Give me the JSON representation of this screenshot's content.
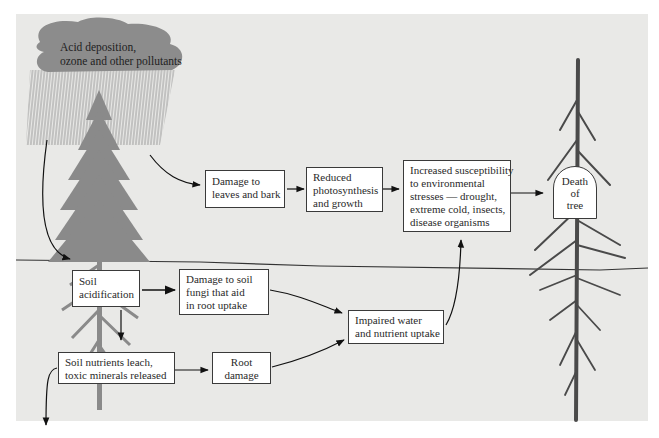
{
  "source": {
    "label_lines": [
      "Acid deposition,",
      "ozone and other pollutants"
    ]
  },
  "nodes": {
    "leaves": {
      "lines": [
        "Damage to",
        "leaves and bark"
      ]
    },
    "photosynthesis": {
      "lines": [
        "Reduced",
        "photosynthesis",
        "and growth"
      ]
    },
    "susceptibility": {
      "lines": [
        "Increased susceptibility",
        "to environmental",
        "stresses — drought,",
        "extreme cold, insects,",
        "disease organisms"
      ]
    },
    "death": {
      "lines": [
        "Death",
        "of",
        "tree"
      ]
    },
    "soil_acid": {
      "lines": [
        "Soil",
        "acidification"
      ]
    },
    "fungi": {
      "lines": [
        "Damage to soil",
        "fungi that aid",
        "in root uptake"
      ]
    },
    "impaired": {
      "lines": [
        "Impaired water",
        "and nutrient uptake"
      ]
    },
    "leach": {
      "lines": [
        "Soil nutrients leach,",
        "toxic minerals released"
      ]
    },
    "root": {
      "lines": [
        "Root",
        "damage"
      ]
    }
  },
  "edges": [
    [
      "source",
      "leaves"
    ],
    [
      "source",
      "soil_acid"
    ],
    [
      "leaves",
      "photosynthesis"
    ],
    [
      "photosynthesis",
      "susceptibility"
    ],
    [
      "susceptibility",
      "death"
    ],
    [
      "soil_acid",
      "fungi"
    ],
    [
      "soil_acid",
      "leach"
    ],
    [
      "fungi",
      "impaired"
    ],
    [
      "leach",
      "root"
    ],
    [
      "leach",
      "groundwater (off-panel)"
    ],
    [
      "root",
      "impaired"
    ],
    [
      "impaired",
      "susceptibility"
    ]
  ],
  "colors": {
    "panel": "#e9e9e7",
    "cloud": "#8c8c8c",
    "tree_healthy": "#8a8a8a",
    "tree_dead": "#4a4a4a",
    "box_border": "#3a3a3a"
  }
}
